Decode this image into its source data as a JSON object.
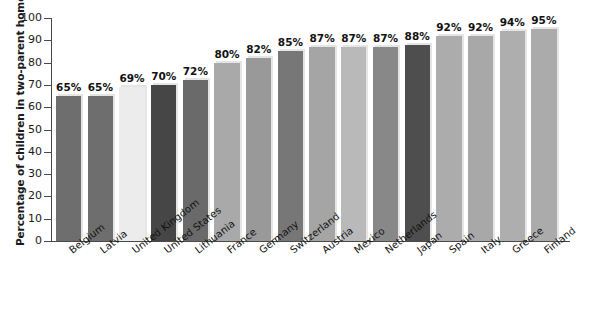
{
  "chart_data": {
    "type": "bar",
    "title": "",
    "subtitle": "",
    "xlabel": "",
    "ylabel": "Percentage of children in two-parent homes",
    "ylim": [
      0,
      100
    ],
    "y_ticks": [
      0,
      10,
      20,
      30,
      40,
      50,
      60,
      70,
      80,
      90,
      100
    ],
    "y_tick_labels": [
      "0",
      "10",
      "20",
      "30",
      "40",
      "50",
      "60",
      "70",
      "80",
      "90",
      "100"
    ],
    "grid": false,
    "legend": "none",
    "value_label_suffix": "%",
    "categories": [
      "Belgium",
      "Latvia",
      "United Kingdom",
      "United States",
      "Lithuania",
      "France",
      "Germany",
      "Switzerland",
      "Austria",
      "Mexico",
      "Netherlands",
      "Japan",
      "Spain",
      "Italy",
      "Greece",
      "Finland"
    ],
    "values": [
      65,
      65,
      69,
      70,
      72,
      80,
      82,
      85,
      87,
      87,
      87,
      88,
      92,
      92,
      94,
      95
    ],
    "value_labels": [
      "65%",
      "65%",
      "69%",
      "70%",
      "72%",
      "80%",
      "82%",
      "85%",
      "87%",
      "87%",
      "87%",
      "88%",
      "92%",
      "92%",
      "94%",
      "95%"
    ],
    "bar_colors": [
      "#6e6e6e",
      "#6e6e6e",
      "#ececec",
      "#464646",
      "#6a6a6a",
      "#a9a9a9",
      "#999999",
      "#777777",
      "#a5a5a5",
      "#b9b9b9",
      "#888888",
      "#4e4e4e",
      "#acacac",
      "#a8a8a8",
      "#aeaeae",
      "#ababab"
    ]
  },
  "colors": {
    "background": "#ffffff",
    "axis": "#4a4a4a",
    "text": "#111111"
  }
}
